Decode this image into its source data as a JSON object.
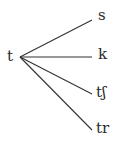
{
  "diagram": {
    "source": {
      "label": "t",
      "x": 8,
      "y": 50
    },
    "origin": {
      "x": 20,
      "y": 57
    },
    "branches": [
      {
        "label": "s",
        "end_x": 92,
        "end_y": 20,
        "label_x": 98,
        "label_y": 8
      },
      {
        "label": "k",
        "end_x": 92,
        "end_y": 57,
        "label_x": 98,
        "label_y": 49
      },
      {
        "label": "tʃ",
        "end_x": 92,
        "end_y": 94,
        "label_x": 96,
        "label_y": 86
      },
      {
        "label": "tr",
        "end_x": 92,
        "end_y": 130,
        "label_x": 96,
        "label_y": 122
      }
    ],
    "line_color": "#333333"
  }
}
